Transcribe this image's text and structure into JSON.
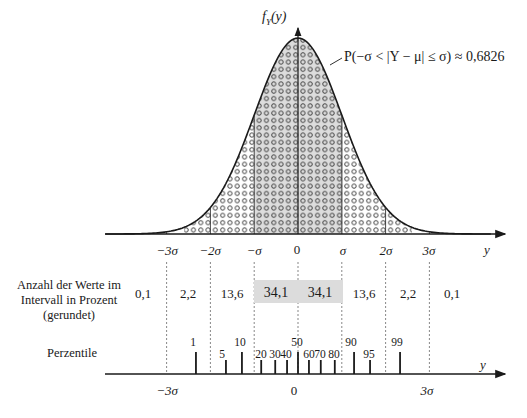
{
  "chart_data": {
    "type": "area",
    "ylabel": "f_Y(y)",
    "xlabel": "y",
    "annotation": "P(−σ < |Y − μ| ≤ σ) ≈ 0,6826",
    "x_ticks": [
      "−3σ",
      "−2σ",
      "−σ",
      "0",
      "σ",
      "2σ",
      "3σ"
    ],
    "interval_row_label": "Anzahl der Werte im Intervall in Prozent (gerundet)",
    "interval_percentages": [
      {
        "interval": "< −3σ",
        "value": "0,1"
      },
      {
        "interval": "−3σ … −2σ",
        "value": "2,2"
      },
      {
        "interval": "−2σ … −σ",
        "value": "13,6"
      },
      {
        "interval": "−σ … 0",
        "value": "34,1",
        "highlight": true
      },
      {
        "interval": "0 … σ",
        "value": "34,1",
        "highlight": true
      },
      {
        "interval": "σ … 2σ",
        "value": "13,6"
      },
      {
        "interval": "2σ … 3σ",
        "value": "2,2"
      },
      {
        "interval": "> 3σ",
        "value": "0,1"
      }
    ],
    "percentile_row_label": "Perzentile",
    "percentiles": [
      {
        "p": "1",
        "z": -2.33
      },
      {
        "p": "5",
        "z": -1.645
      },
      {
        "p": "10",
        "z": -1.28
      },
      {
        "p": "20",
        "z": -0.84
      },
      {
        "p": "30",
        "z": -0.52
      },
      {
        "p": "40",
        "z": -0.25
      },
      {
        "p": "50",
        "z": 0
      },
      {
        "p": "60",
        "z": 0.25
      },
      {
        "p": "70",
        "z": 0.52
      },
      {
        "p": "80",
        "z": 0.84
      },
      {
        "p": "90",
        "z": 1.28
      },
      {
        "p": "95",
        "z": 1.645
      },
      {
        "p": "99",
        "z": 2.33
      }
    ],
    "percentile_axis_ticks": [
      "−3σ",
      "0",
      "3σ"
    ],
    "percentile_axis_label": "y",
    "shaded_region": [
      -1,
      1
    ],
    "grid": false
  },
  "labels": {
    "density": "f",
    "density_sub": "Y",
    "density_arg": "(y)",
    "annotation": "P(−σ < |Y − μ| ≤ σ) ≈ 0,6826",
    "axis_y": "y",
    "ticks": [
      "−3σ",
      "−2σ",
      "−σ",
      "0",
      "σ",
      "2σ",
      "3σ"
    ],
    "row1_line1": "Anzahl der Werte im",
    "row1_line2": "Intervall in Prozent",
    "row1_line3": "(gerundet)",
    "pcts": [
      "0,1",
      "2,2",
      "13,6",
      "34,1",
      "34,1",
      "13,6",
      "2,2",
      "0,1"
    ],
    "row2": "Perzentile",
    "plabels": [
      "1",
      "5",
      "10",
      "20",
      "30",
      "40",
      "50",
      "60",
      "70",
      "80",
      "90",
      "95",
      "99"
    ],
    "bottom_ticks": [
      "−3σ",
      "0",
      "3σ"
    ],
    "bottom_axis_y": "y"
  },
  "colors": {
    "shade": "#dcdcdc",
    "ink": "#1a1a1a"
  }
}
